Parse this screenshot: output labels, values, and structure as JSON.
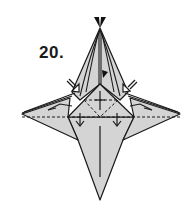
{
  "step": {
    "number_label": "20."
  },
  "diagram": {
    "colors": {
      "paper_fill": "#d4d4d4",
      "line": "#1a1a1a",
      "background": "#ffffff"
    },
    "symbols": [
      {
        "name": "valley-fold-line-horizontal",
        "type": "dashed"
      },
      {
        "name": "valley-fold-line-upper-square",
        "type": "dashed"
      },
      {
        "name": "fold-down-arrow-left",
        "type": "arrow"
      },
      {
        "name": "fold-down-arrow-right",
        "type": "arrow"
      },
      {
        "name": "push-arrow-left",
        "type": "hollow-arrow"
      },
      {
        "name": "push-arrow-right",
        "type": "hollow-arrow"
      },
      {
        "name": "top-tip-black-wedges",
        "type": "filled"
      },
      {
        "name": "small-black-flag",
        "type": "filled"
      }
    ]
  }
}
